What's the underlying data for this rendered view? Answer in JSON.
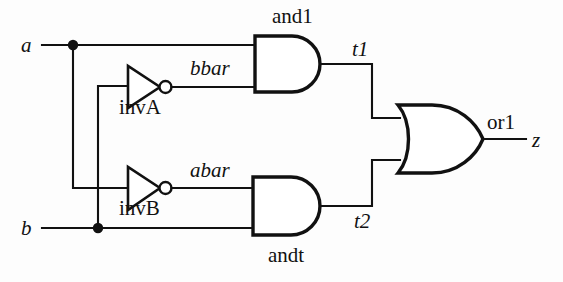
{
  "diagram": {
    "stroke_color": "#111111",
    "background_color": "#fdfdfd"
  },
  "ports": {
    "inputs": [
      {
        "name": "a",
        "label": "a",
        "x": 28,
        "y": 52
      },
      {
        "name": "b",
        "label": "b",
        "x": 28,
        "y": 235
      }
    ],
    "outputs": [
      {
        "name": "z",
        "label": "z",
        "x": 532,
        "y": 147
      }
    ]
  },
  "gates": [
    {
      "id": "and1",
      "type": "and",
      "label": "and1",
      "label_x": 295,
      "label_y": 27
    },
    {
      "id": "andt",
      "type": "and",
      "label": "andt",
      "label_x": 293,
      "label_y": 264
    },
    {
      "id": "invA",
      "type": "inverter",
      "label": "invA",
      "label_x": 143,
      "label_y": 113
    },
    {
      "id": "invB",
      "type": "inverter",
      "label": "invB",
      "label_x": 143,
      "label_y": 215
    },
    {
      "id": "or1",
      "type": "or",
      "label": "or1",
      "label_x": 504,
      "label_y": 129
    }
  ],
  "nets": [
    {
      "name": "bbar",
      "label": "bbar",
      "x": 210,
      "y": 78
    },
    {
      "name": "abar",
      "label": "abar",
      "x": 210,
      "y": 180
    },
    {
      "name": "t1",
      "label": "t1",
      "x": 359,
      "y": 57
    },
    {
      "name": "t2",
      "label": "t2",
      "x": 361,
      "y": 229
    }
  ],
  "junctions": [
    {
      "net": "a",
      "x": 73,
      "y": 45
    },
    {
      "net": "b",
      "x": 98,
      "y": 228
    }
  ],
  "connections": [
    {
      "from": "a",
      "to": "and1.in0"
    },
    {
      "from": "a",
      "to": "invB.in"
    },
    {
      "from": "b",
      "to": "invA.in"
    },
    {
      "from": "b",
      "to": "andt.in1"
    },
    {
      "from": "invA.out",
      "to": "and1.in1",
      "net": "bbar"
    },
    {
      "from": "invB.out",
      "to": "andt.in0",
      "net": "abar"
    },
    {
      "from": "and1.out",
      "to": "or1.in0",
      "net": "t1"
    },
    {
      "from": "andt.out",
      "to": "or1.in1",
      "net": "t2"
    },
    {
      "from": "or1.out",
      "to": "z"
    }
  ]
}
